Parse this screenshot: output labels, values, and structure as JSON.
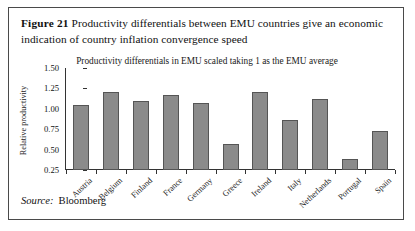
{
  "figure": {
    "label": "Figure 21",
    "caption": "Productivity differentials between EMU countries give an economic indication of country inflation convergence speed"
  },
  "source": {
    "word": "Source:",
    "name": "Bloomberg"
  },
  "chart_data": {
    "type": "bar",
    "title": "Productivity differentials in EMU scaled taking 1 as the EMU average",
    "xlabel": "",
    "ylabel": "Relative productivity",
    "categories": [
      "Austria",
      "Belgium",
      "Finland",
      "France",
      "Germany",
      "Greece",
      "Ireland",
      "Italy",
      "Netherlands",
      "Portugal",
      "Spain"
    ],
    "values": [
      1.05,
      1.2,
      1.1,
      1.17,
      1.07,
      0.57,
      1.2,
      0.86,
      1.12,
      0.39,
      0.73
    ],
    "ylim": [
      0.25,
      1.5
    ],
    "yticks": [
      "1.50",
      "1.25",
      "1.00",
      "0.75",
      "0.50",
      "0.25"
    ],
    "ytick_values": [
      1.5,
      1.25,
      1.0,
      0.75,
      0.5,
      0.25
    ],
    "grid": false,
    "legend": false,
    "bar_color": "#8b8b8b",
    "bar_edge_color": "#555555"
  }
}
